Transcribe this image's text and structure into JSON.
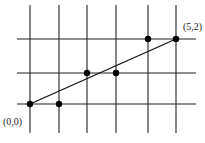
{
  "diagram": {
    "grid": {
      "columns_x": [
        30,
        59,
        87,
        116,
        148,
        176
      ],
      "rows_y": [
        39,
        73,
        104
      ],
      "v_top": 5,
      "v_bottom": 133,
      "h_left": 17,
      "h_right": 196
    },
    "segment": {
      "from": [
        0,
        0
      ],
      "to": [
        5,
        2
      ]
    },
    "points": [
      {
        "grid": [
          0,
          0
        ]
      },
      {
        "grid": [
          1,
          0
        ]
      },
      {
        "grid": [
          2,
          1
        ]
      },
      {
        "grid": [
          3,
          1
        ]
      },
      {
        "grid": [
          4,
          2
        ]
      },
      {
        "grid": [
          5,
          2
        ]
      }
    ],
    "labels": {
      "origin": "(0,0)",
      "end": "(5,2)"
    },
    "colors": {
      "line": "#111111",
      "point": "#000000"
    }
  }
}
